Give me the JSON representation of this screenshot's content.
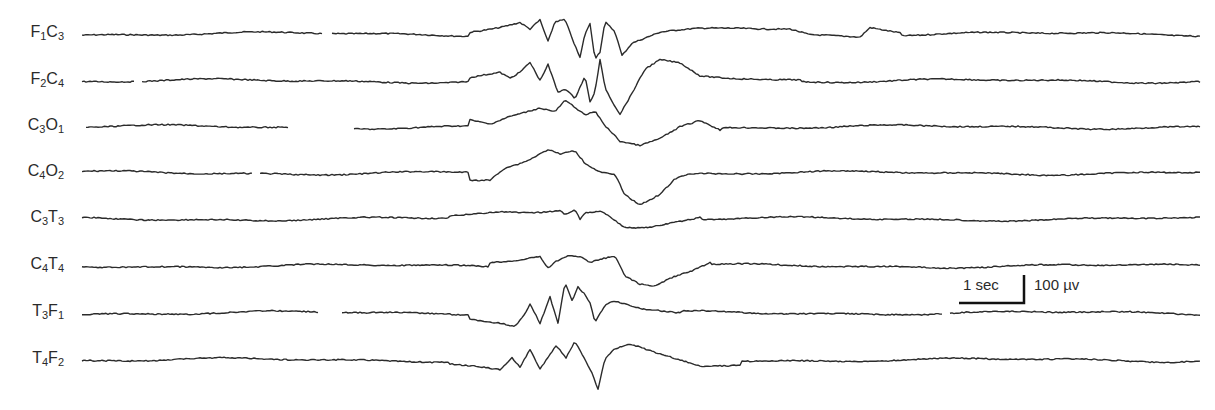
{
  "chart_data": {
    "type": "line",
    "title": "",
    "xlabel": "",
    "ylabel": "",
    "grid": false,
    "legend": "none",
    "channels": [
      {
        "label_main": "F",
        "sub1": "1",
        "label_second": "C",
        "sub2": "3",
        "name": "F1C3",
        "baseline_y": 34
      },
      {
        "label_main": "F",
        "sub1": "2",
        "label_second": "C",
        "sub2": "4",
        "name": "F2C4",
        "baseline_y": 81
      },
      {
        "label_main": "C",
        "sub1": "3",
        "label_second": "O",
        "sub2": "1",
        "name": "C3O1",
        "baseline_y": 127
      },
      {
        "label_main": "C",
        "sub1": "4",
        "label_second": "O",
        "sub2": "2",
        "name": "C4O2",
        "baseline_y": 173
      },
      {
        "label_main": "C",
        "sub1": "3",
        "label_second": "T",
        "sub2": "3",
        "name": "C3T3",
        "baseline_y": 219
      },
      {
        "label_main": "C",
        "sub1": "4",
        "label_second": "T",
        "sub2": "4",
        "name": "C4T4",
        "baseline_y": 266
      },
      {
        "label_main": "T",
        "sub1": "3",
        "label_second": "F",
        "sub2": "1",
        "name": "T3F1",
        "baseline_y": 313
      },
      {
        "label_main": "T",
        "sub1": "4",
        "label_second": "F",
        "sub2": "2",
        "name": "T4F2",
        "baseline_y": 360
      }
    ],
    "scale_bar": {
      "time_label": "1 sec",
      "amplitude_label": "100 µv",
      "time_px": 65,
      "amplitude_px": 28
    },
    "burst_region_x": [
      490,
      680
    ]
  }
}
